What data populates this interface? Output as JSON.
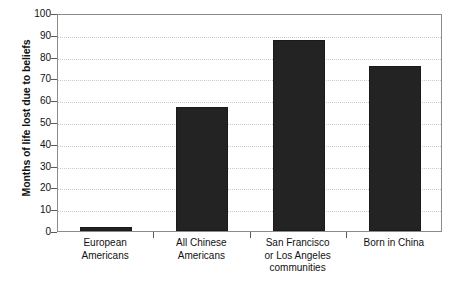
{
  "chart_data": {
    "type": "bar",
    "title": "",
    "subtitle": "",
    "xlabel": "",
    "ylabel": "Months of life lost due to beliefs",
    "ylim": [
      0,
      100
    ],
    "ytick_step": 10,
    "yticks": [
      100,
      90,
      80,
      70,
      60,
      50,
      40,
      30,
      20,
      10,
      0
    ],
    "grid": true,
    "legend": false,
    "legend_position": "none",
    "bar_color": "#232323",
    "categories": [
      "European Americans",
      "All Chinese Americans",
      "San Francisco or Los Angeles communities",
      "Born in China"
    ],
    "category_label_lines": [
      [
        "European",
        "Americans"
      ],
      [
        "All Chinese",
        "Americans"
      ],
      [
        "San Francisco",
        "or Los Angeles",
        "communities"
      ],
      [
        "Born in China"
      ]
    ],
    "values": [
      2,
      57,
      87.5,
      75.5
    ],
    "series": [
      {
        "name": "Months of life lost due to beliefs",
        "values": [
          2,
          57,
          87.5,
          75.5
        ]
      }
    ]
  },
  "axis": {
    "frame_color": "#8b8b8b",
    "grid_color": "#c9c9c9",
    "tick_color": "#5a5a5a"
  }
}
